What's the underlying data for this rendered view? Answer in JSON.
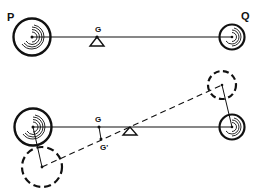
{
  "diagram": {
    "top": {
      "label_p": "P",
      "label_q": "Q",
      "label_g": "G"
    },
    "bottom": {
      "label_g": "G",
      "label_g_prime": "G'"
    }
  },
  "colors": {
    "ink": "#111111",
    "background": "#ffffff"
  }
}
